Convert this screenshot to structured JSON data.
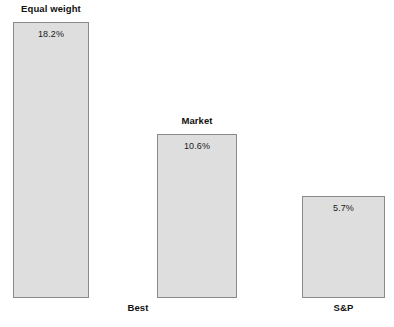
{
  "chart_data": {
    "type": "bar",
    "title": "",
    "xlabel": "",
    "ylabel": "",
    "grid": false,
    "legend": "none",
    "ylim": [
      0,
      18.2
    ],
    "categories": [
      "Equal weight",
      "Market",
      "S&P"
    ],
    "values": [
      18.2,
      10.6,
      5.7
    ],
    "value_labels": [
      "18.2%",
      "10.6%",
      "5.7%"
    ],
    "series": [
      {
        "name": "Annualized return",
        "values": [
          18.2,
          10.6,
          5.7
        ]
      }
    ],
    "annotations": [
      {
        "text": "Best",
        "position": "below-baseline-between-bar1-and-bar2"
      }
    ],
    "bar_fill_color": "#dedede",
    "bar_border_color": "#8a8a8a",
    "background_color": "#ffffff",
    "text_color": "#1a1a1a"
  },
  "bars": [
    {
      "label": "Equal weight",
      "value_label": "18.2%",
      "value": 18.2,
      "label_position": "above"
    },
    {
      "label": "Market",
      "value_label": "10.6%",
      "value": 10.6,
      "label_position": "above"
    },
    {
      "label": "S&P",
      "value_label": "5.7%",
      "value": 5.7,
      "label_position": "below"
    }
  ],
  "captions": {
    "best": "Best"
  }
}
